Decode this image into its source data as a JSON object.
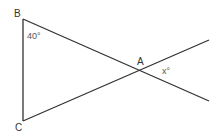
{
  "diagram": {
    "type": "geometry",
    "line_color": "#333333",
    "points": {
      "B": {
        "label": "B",
        "x": 23,
        "y": 19
      },
      "C": {
        "label": "C",
        "x": 23,
        "y": 121
      },
      "A": {
        "label": "A",
        "x": 141,
        "y": 70
      }
    },
    "segments": [
      {
        "from": "B",
        "to": "C"
      },
      {
        "from": "B",
        "to": "A",
        "extended_to": {
          "x": 209,
          "y": 101
        }
      },
      {
        "from": "C",
        "to": "A",
        "extended_to": {
          "x": 209,
          "y": 40
        }
      }
    ],
    "angles": [
      {
        "at": "B",
        "label": "40°"
      },
      {
        "at": "A",
        "label": "x°"
      }
    ]
  }
}
